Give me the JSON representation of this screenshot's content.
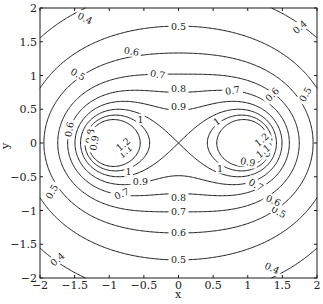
{
  "chart_data": {
    "type": "contour",
    "title": "",
    "xlabel": "x",
    "ylabel": "y",
    "xlim": [
      -2,
      2
    ],
    "ylim": [
      -2,
      2
    ],
    "grid": false,
    "legend": null,
    "function": "f(x,y) = |z^2 - 1|^(-1/2), z = x + iy",
    "levels": [
      0.4,
      0.5,
      0.6,
      0.7,
      0.8,
      0.9,
      1.0,
      1.1,
      1.2
    ],
    "level_labels": [
      "0.4",
      "0.5",
      "0.6",
      "0.7",
      "0.8",
      "0.9",
      "1",
      "1.1",
      "1.2"
    ],
    "xticks": [
      -2,
      -1.5,
      -1,
      -0.5,
      0,
      0.5,
      1,
      1.5,
      2
    ],
    "xtick_labels": [
      "−2",
      "−1.5",
      "−1",
      "−0.5",
      "0",
      "0.5",
      "1",
      "1.5",
      "2"
    ],
    "yticks": [
      -2,
      -1.5,
      -1,
      -0.5,
      0,
      0.5,
      1,
      1.5,
      2
    ],
    "ytick_labels": [
      "−2",
      "−1.5",
      "−1",
      "−0.5",
      "0",
      "0.5",
      "1",
      "1.5",
      "2"
    ],
    "contour_label_positions": [
      {
        "level": "0.4",
        "x": -1.35,
        "y": 1.85,
        "angle": -25
      },
      {
        "level": "0.4",
        "x": 1.75,
        "y": 1.72,
        "angle": 40
      },
      {
        "level": "0.4",
        "x": -1.75,
        "y": -1.72,
        "angle": 40
      },
      {
        "level": "0.4",
        "x": 1.35,
        "y": -1.85,
        "angle": -25
      },
      {
        "level": "0.5",
        "x": 0.0,
        "y": 1.72,
        "angle": 0
      },
      {
        "level": "0.5",
        "x": -1.45,
        "y": 1.02,
        "angle": -30
      },
      {
        "level": "0.5",
        "x": 1.83,
        "y": 0.72,
        "angle": 60
      },
      {
        "level": "0.5",
        "x": -1.83,
        "y": -0.72,
        "angle": 60
      },
      {
        "level": "0.5",
        "x": 1.45,
        "y": -1.02,
        "angle": -30
      },
      {
        "level": "0.5",
        "x": 0.0,
        "y": -1.72,
        "angle": 0
      },
      {
        "level": "0.6",
        "x": -0.68,
        "y": 1.36,
        "angle": -8
      },
      {
        "level": "0.6",
        "x": 1.35,
        "y": 0.72,
        "angle": 45
      },
      {
        "level": "0.6",
        "x": -1.58,
        "y": 0.2,
        "angle": 80
      },
      {
        "level": "0.6",
        "x": 1.37,
        "y": -0.85,
        "angle": -25
      },
      {
        "level": "0.6",
        "x": 0.0,
        "y": -1.33,
        "angle": 0
      },
      {
        "level": "0.7",
        "x": -0.3,
        "y": 1.02,
        "angle": -8
      },
      {
        "level": "0.7",
        "x": 0.78,
        "y": 0.78,
        "angle": 10
      },
      {
        "level": "0.7",
        "x": -0.82,
        "y": -0.75,
        "angle": 25
      },
      {
        "level": "0.7",
        "x": 1.12,
        "y": -0.62,
        "angle": -30
      },
      {
        "level": "0.7",
        "x": 0.0,
        "y": -1.02,
        "angle": 0
      },
      {
        "level": "0.8",
        "x": 0.0,
        "y": 0.81,
        "angle": 0
      },
      {
        "level": "0.8",
        "x": -1.28,
        "y": 0.1,
        "angle": 80
      },
      {
        "level": "0.8",
        "x": 1.28,
        "y": -0.1,
        "angle": 80
      },
      {
        "level": "0.8",
        "x": 0.0,
        "y": -0.81,
        "angle": 0
      },
      {
        "level": "0.9",
        "x": 0.0,
        "y": 0.54,
        "angle": 0
      },
      {
        "level": "0.9",
        "x": -1.22,
        "y": 0.0,
        "angle": 80
      },
      {
        "level": "0.9",
        "x": 1.0,
        "y": -0.28,
        "angle": -10
      },
      {
        "level": "0.9",
        "x": -0.55,
        "y": -0.57,
        "angle": 0
      },
      {
        "level": "1",
        "x": -0.55,
        "y": 0.35,
        "angle": 0
      },
      {
        "level": "1",
        "x": 0.55,
        "y": 0.32,
        "angle": 35
      },
      {
        "level": "1",
        "x": -0.72,
        "y": -0.42,
        "angle": 0
      },
      {
        "level": "1",
        "x": 0.6,
        "y": -0.37,
        "angle": 0
      },
      {
        "level": "1.1",
        "x": -0.77,
        "y": -0.12,
        "angle": 40
      },
      {
        "level": "1.1",
        "x": 1.22,
        "y": -0.12,
        "angle": 40
      },
      {
        "level": "1.2",
        "x": -0.8,
        "y": -0.02,
        "angle": 40
      },
      {
        "level": "1.2",
        "x": 1.2,
        "y": 0.05,
        "angle": 40
      }
    ]
  },
  "plot": {
    "x_axis_label": "x",
    "y_axis_label": "y"
  }
}
